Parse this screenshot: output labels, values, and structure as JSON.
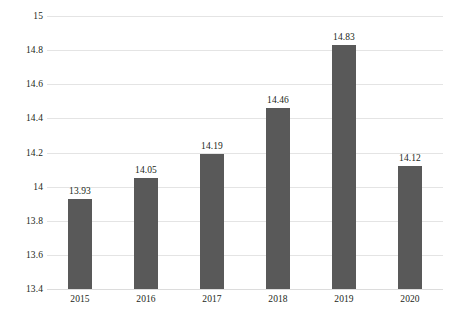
{
  "chart_data": {
    "type": "bar",
    "title": "",
    "subtitle": "",
    "xlabel": "",
    "ylabel": "",
    "categories": [
      "2015",
      "2016",
      "2017",
      "2018",
      "2019",
      "2020"
    ],
    "values": [
      13.93,
      14.05,
      14.19,
      14.46,
      14.83,
      14.12
    ],
    "value_labels": [
      "13.93",
      "14.05",
      "14.19",
      "14.46",
      "14.83",
      "14.12"
    ],
    "series": [
      {
        "name": "",
        "values": [
          13.93,
          14.05,
          14.19,
          14.46,
          14.83,
          14.12
        ]
      }
    ],
    "ylim": [
      13.4,
      15
    ],
    "y_ticks": [
      13.4,
      13.6,
      13.8,
      14,
      14.2,
      14.4,
      14.6,
      14.8,
      15
    ],
    "y_tick_labels": [
      "13.4",
      "13.6",
      "13.8",
      "14",
      "14.2",
      "14.4",
      "14.6",
      "14.8",
      "15"
    ],
    "grid": "horizontal",
    "legend": "none",
    "bar_color": "#595959",
    "gridline_color": "#e4e4e4",
    "background_color": "#ffffff",
    "text_color": "#231f20"
  }
}
